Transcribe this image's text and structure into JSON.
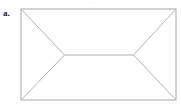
{
  "figure": {
    "panel_label": "a.",
    "top_cut_text": "··",
    "background_color": "#ffffff",
    "canvas": {
      "width": 181,
      "height": 105
    },
    "geometry": {
      "rectangle": {
        "left": 21,
        "top": 9,
        "right": 176,
        "bottom": 100,
        "stroke_color": "#a8a8a8",
        "stroke_width": 1
      },
      "inner_vertices": {
        "left": {
          "x": 64.5,
          "y": 55
        },
        "right": {
          "x": 133.5,
          "y": 55
        },
        "stroke_color": "#b3b3b3",
        "stroke_width": 1
      },
      "diagonals": [
        {
          "name": "top-left-to-left-vertex",
          "x1": 21,
          "y1": 9,
          "x2": 64.5,
          "y2": 55
        },
        {
          "name": "bottom-left-to-left-vertex",
          "x1": 21,
          "y1": 100,
          "x2": 64.5,
          "y2": 55
        },
        {
          "name": "top-right-to-right-vertex",
          "x1": 176,
          "y1": 9,
          "x2": 133.5,
          "y2": 55
        },
        {
          "name": "bottom-right-to-right-vertex",
          "x1": 176,
          "y1": 100,
          "x2": 133.5,
          "y2": 55
        }
      ],
      "ridge_segment": {
        "x1": 64.5,
        "y1": 55,
        "x2": 133.5,
        "y2": 55
      }
    }
  }
}
